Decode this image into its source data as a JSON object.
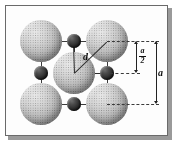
{
  "figure": {
    "type": "crystal-unit-cell-diagram",
    "background_color": "#fdfdfd",
    "frame_color": "#6a6a6a",
    "large_sphere_color": "#b4b4b4",
    "small_sphere_color": "#2b2b2b",
    "cell_outline_color": "#3b3b3b"
  },
  "labels": {
    "bond_distance": "d",
    "lattice_parameter": "a",
    "half_lattice_numerator": "a",
    "half_lattice_denominator": "2"
  },
  "atoms": {
    "large": [
      {
        "name": "corner-atom-top-left",
        "cx": 41,
        "cy": 41,
        "r": 21
      },
      {
        "name": "corner-atom-top-right",
        "cx": 107,
        "cy": 41,
        "r": 21
      },
      {
        "name": "corner-atom-bottom-left",
        "cx": 41,
        "cy": 104,
        "r": 21
      },
      {
        "name": "corner-atom-bottom-right",
        "cx": 107,
        "cy": 104,
        "r": 21
      },
      {
        "name": "centre-atom",
        "cx": 74,
        "cy": 73,
        "r": 21
      }
    ],
    "small": [
      {
        "name": "edge-atom-top",
        "cx": 74,
        "cy": 41,
        "r": 7
      },
      {
        "name": "edge-atom-bottom",
        "cx": 74,
        "cy": 104,
        "r": 7
      },
      {
        "name": "edge-atom-left",
        "cx": 41,
        "cy": 73,
        "r": 7
      },
      {
        "name": "edge-atom-right",
        "cx": 107,
        "cy": 73,
        "r": 7
      }
    ]
  },
  "cell": {
    "left": 41,
    "top": 41,
    "size": 66
  },
  "dimensions": [
    {
      "name": "half-lattice-dimension",
      "label": "a/2",
      "from_y": 41,
      "to_y": 73,
      "x": 136
    },
    {
      "name": "lattice-dimension",
      "label": "a",
      "from_y": 41,
      "to_y": 104,
      "x": 156
    }
  ]
}
